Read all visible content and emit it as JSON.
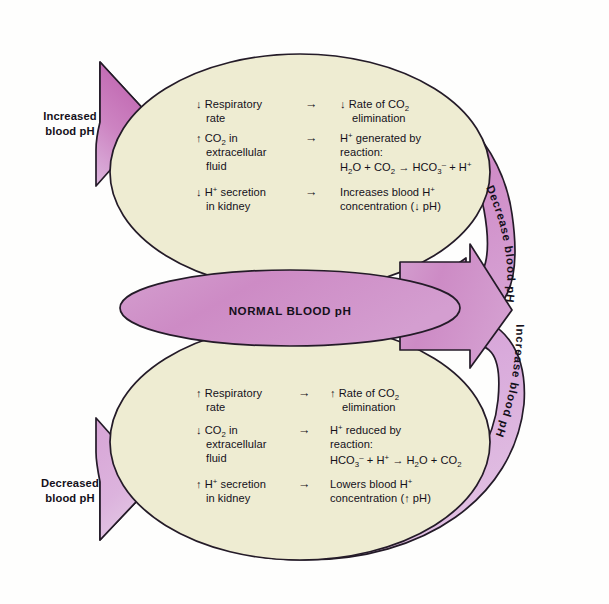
{
  "diagram": {
    "center_node": {
      "label": "NORMAL BLOOD pH"
    },
    "colors": {
      "background": "#fefefd",
      "body_fill": "#eeecd2",
      "arrow_dark_magenta": "#c06cb0",
      "arrow_mid_pink": "#cf8ec6",
      "arrow_light_lavender": "#dcb6de",
      "outline": "#241b28",
      "text": "#14101a"
    },
    "arrow_labels": {
      "top_left": {
        "line1": "Increased",
        "line2": "blood pH"
      },
      "bottom_left": {
        "line1": "Decreased",
        "line2": "blood pH"
      },
      "right_upper": "Decrease blood pH",
      "right_lower": "Increase blood pH"
    },
    "top_pathway": {
      "name": "acidosis-compensation-upper-loop",
      "rows": [
        {
          "cause": [
            {
              "arrow": "↓",
              "text": "Respiratory"
            },
            {
              "arrow": "",
              "text": "rate"
            }
          ],
          "connector": "→",
          "effect": [
            {
              "arrow": "↓",
              "text": "Rate of CO",
              "sub": "2"
            },
            {
              "arrow": "",
              "text": "elimination"
            }
          ]
        },
        {
          "cause": [
            {
              "arrow": "↑",
              "text": "CO",
              "sub": "2",
              "tail": " in"
            },
            {
              "arrow": "",
              "text": "extracellular"
            },
            {
              "arrow": "",
              "text": "fluid"
            }
          ],
          "connector": "→",
          "effect_html": "special_generated",
          "effect_lines": [
            "H+ generated by",
            "reaction:",
            "H2O + CO2 → HCO3- + H+"
          ]
        },
        {
          "cause": [
            {
              "arrow": "↓",
              "text": "H",
              "sup": "+",
              "tail": " secretion"
            },
            {
              "arrow": "",
              "text": "in kidney"
            }
          ],
          "connector": "→",
          "effect_lines": [
            "Increases blood H+",
            "concentration (↓ pH)"
          ]
        }
      ]
    },
    "bottom_pathway": {
      "name": "alkalosis-compensation-lower-loop",
      "rows": [
        {
          "cause": [
            {
              "arrow": "↑",
              "text": "Respiratory"
            },
            {
              "arrow": "",
              "text": "rate"
            }
          ],
          "connector": "→",
          "effect_lines": [
            "↑ Rate of CO2",
            "elimination"
          ]
        },
        {
          "cause": [
            {
              "arrow": "↓",
              "text": "CO",
              "sub": "2",
              "tail": " in"
            },
            {
              "arrow": "",
              "text": "extracellular"
            },
            {
              "arrow": "",
              "text": "fluid"
            }
          ],
          "connector": "→",
          "effect_lines": [
            "H+ reduced by",
            "reaction:",
            "HCO3- + H+ → H2O + CO2"
          ]
        },
        {
          "cause": [
            {
              "arrow": "↑",
              "text": "H",
              "sup": "+",
              "tail": " secretion"
            },
            {
              "arrow": "",
              "text": "in kidney"
            }
          ],
          "connector": "→",
          "effect_lines": [
            "Lowers blood H+",
            "concentration (↑ pH)"
          ]
        }
      ]
    },
    "text_tokens": {
      "top": {
        "r1c1a": "↓ Respiratory",
        "r1c1b": "rate",
        "r1conn": "→",
        "r1c2a_pre": "↓ Rate of CO",
        "r1c2a_sub": "2",
        "r1c2b": "elimination",
        "r2c1a_pre": "↑ CO",
        "r2c1a_sub": "2",
        "r2c1a_post": " in",
        "r2c1b": "extracellular",
        "r2c1c": "fluid",
        "r2conn": "→",
        "r2c2a_pre": "H",
        "r2c2a_sup": "+",
        "r2c2a_post": " generated by",
        "r2c2b": "reaction:",
        "r2c2c_h": "H",
        "r2c2c_2": "2",
        "r2c2c_o": "O + CO",
        "r2c2c_2b": "2",
        "r2c2c_arrow": " → HCO",
        "r2c2c_3": "3",
        "r2c2c_minus": "–",
        "r2c2c_plus": " + H",
        "r2c2c_sup": "+",
        "r3c1a_pre": "↓ H",
        "r3c1a_sup": "+",
        "r3c1a_post": " secretion",
        "r3c1b": "in kidney",
        "r3conn": "→",
        "r3c2a_pre": "Increases blood H",
        "r3c2a_sup": "+",
        "r3c2b": "concentration (↓ pH)"
      },
      "bottom": {
        "r1c1a": "↑ Respiratory",
        "r1c1b": "rate",
        "r1conn": "→",
        "r1c2a_pre": "↑ Rate of CO",
        "r1c2a_sub": "2",
        "r1c2b": "elimination",
        "r2c1a_pre": "↓ CO",
        "r2c1a_sub": "2",
        "r2c1a_post": " in",
        "r2c1b": "extracellular",
        "r2c1c": "fluid",
        "r2conn": "→",
        "r2c2a_pre": "H",
        "r2c2a_sup": "+",
        "r2c2a_post": " reduced by",
        "r2c2b": "reaction:",
        "r2c2c_hco": "HCO",
        "r2c2c_3": "3",
        "r2c2c_minus": "–",
        "r2c2c_plusH": " + H",
        "r2c2c_sup": "+",
        "r2c2c_arrow": " → H",
        "r2c2c_2": "2",
        "r2c2c_oco": "O + CO",
        "r2c2c_2b": "2",
        "r3c1a_pre": "↑ H",
        "r3c1a_sup": "+",
        "r3c1a_post": " secretion",
        "r3c1b": "in kidney",
        "r3conn": "→",
        "r3c2a_pre": "Lowers blood H",
        "r3c2a_sup": "+",
        "r3c2b": "concentration (↑ pH)"
      }
    }
  }
}
